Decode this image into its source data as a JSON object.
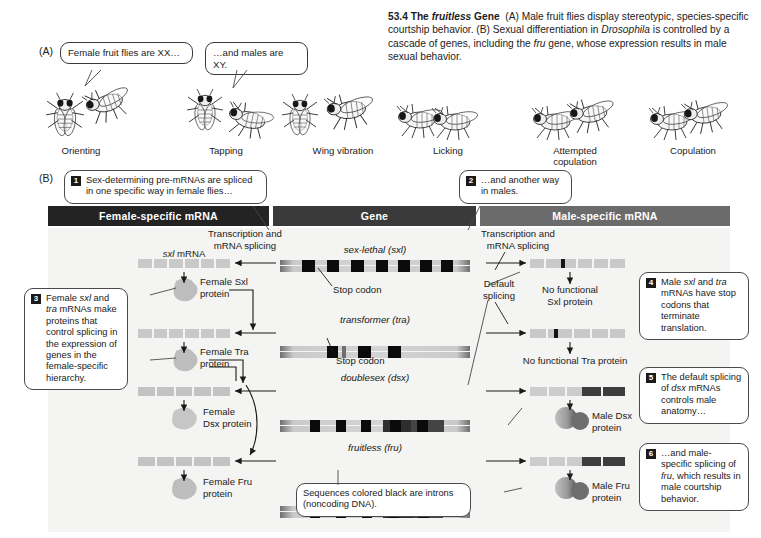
{
  "figure": {
    "number": "53.4",
    "title": "The fruitless Gene",
    "title_plain": "The ",
    "title_italic": "fruitless",
    "title_tail": " Gene",
    "caption_a": "(A) Male fruit flies display stereotypic, species-specific courtship behavior.",
    "caption_b_1": "(B) Sexual differentiation in ",
    "caption_b_italic1": "Drosophila",
    "caption_b_2": " is controlled by a cascade of genes, including the ",
    "caption_b_italic2": "fru",
    "caption_b_3": " gene, whose expression results in male sexual behavior."
  },
  "panelA": {
    "letter": "(A)",
    "bubbles": [
      {
        "text": "Female fruit flies are XX…"
      },
      {
        "text": "…and males are XY."
      }
    ],
    "behaviors": [
      {
        "label": "Orienting"
      },
      {
        "label": "Tapping"
      },
      {
        "label": "Wing vibration"
      },
      {
        "label": "Licking"
      },
      {
        "label": "Attempted",
        "label2": "copulation"
      },
      {
        "label": "Copulation"
      }
    ]
  },
  "panelB": {
    "letter": "(B)",
    "headers": [
      {
        "label": "Female-specific mRNA",
        "color": "#232323"
      },
      {
        "label": "Gene",
        "color": "#3a3a3a"
      },
      {
        "label": "Male-specific mRNA",
        "color": "#6b6b6b"
      }
    ],
    "callouts": [
      {
        "num": "1",
        "text": "Sex-determining pre-mRNAs are spliced in one specific way in female flies…"
      },
      {
        "num": "2",
        "text": "…and another way in males."
      },
      {
        "num": "3",
        "pre": "Female ",
        "it1": "sxl",
        "mid": " and ",
        "it2": "tra",
        "post": " mRNAs make proteins that control splicing in the expression of genes in the female-specific hierarchy."
      },
      {
        "num": "4",
        "pre": "Male ",
        "it1": "sxl",
        "mid": " and ",
        "it2": "tra",
        "post": " mRNAs have stop codons that terminate translation."
      },
      {
        "num": "5",
        "pre": "The default splicing of ",
        "it1": "dsx",
        "post": " mRNAs controls male anatomy…"
      },
      {
        "num": "6",
        "pre": "…and male-specific splicing of ",
        "it1": "fru",
        "post": ", which results in male courtship behavior."
      }
    ],
    "introns_note": "Sequences colored black are introns (noncoding DNA).",
    "genes": [
      {
        "name": "sex-lethal (sxl)",
        "stop_label": "Stop codon"
      },
      {
        "name": "transformer (tra)",
        "stop_label": "Stop codon"
      },
      {
        "name": "doublesex (dsx)"
      },
      {
        "name": "fruitless (fru)"
      }
    ],
    "process_labels": {
      "transcription_left": "Transcription and mRNA splicing",
      "transcription_right": "Transcription and mRNA splicing",
      "default_splicing": "Default splicing"
    },
    "female_column": {
      "mrna_label": "sxl mRNA",
      "mrna_label_italic": "sxl",
      "mrna_label_tail": " mRNA",
      "proteins": [
        {
          "label": "Female Sxl",
          "label2": "protein"
        },
        {
          "label": "Female Tra",
          "label2": "protein"
        },
        {
          "label": "Female",
          "label2": "Dsx protein"
        },
        {
          "label": "Female Fru",
          "label2": "protein"
        }
      ]
    },
    "male_column": {
      "proteins": [
        {
          "label": "No functional",
          "label2": "Sxl protein"
        },
        {
          "label": "No functional Tra protein"
        },
        {
          "label": "Male Dsx",
          "label2": "protein"
        },
        {
          "label": "Male Fru",
          "label2": "protein"
        }
      ]
    }
  },
  "colors": {
    "bar_female": "#232323",
    "bar_gene": "#3a3a3a",
    "bar_male": "#6b6b6b",
    "mrna_light": "#c9c9c9",
    "mrna_dark": "#4a4a4a",
    "intron_black": "#0b0b0b",
    "page_bg": "#ffffff",
    "panel_bg": "#f3f3f1"
  }
}
